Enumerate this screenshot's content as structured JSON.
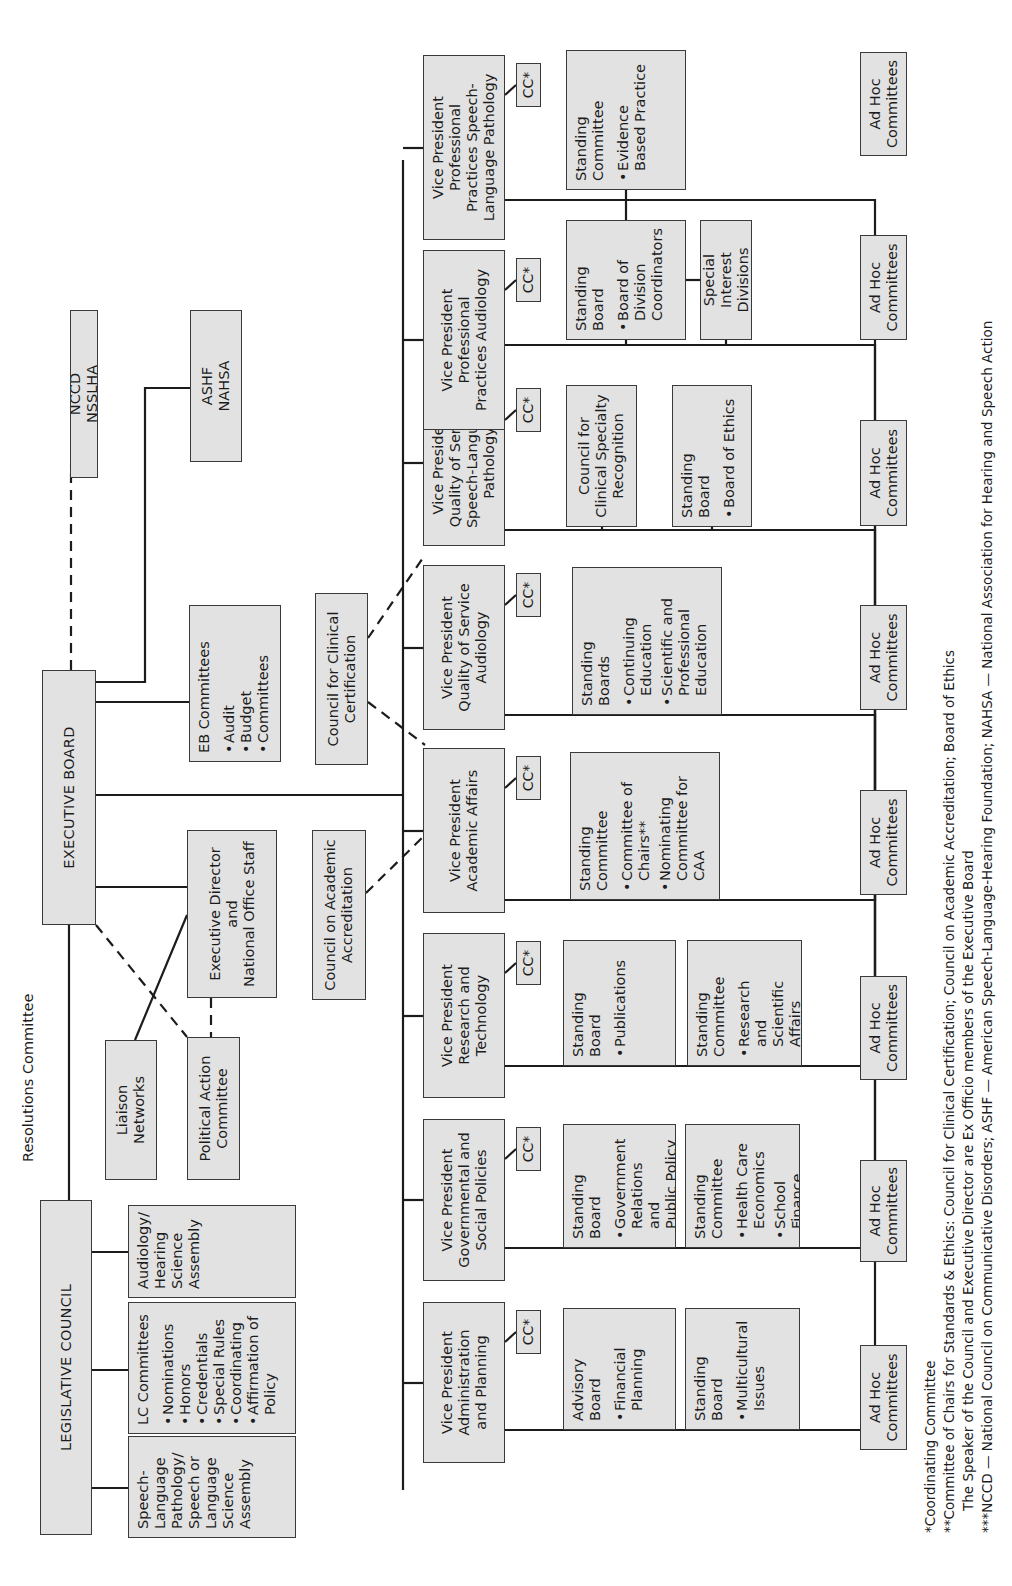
{
  "top_level": {
    "legislative_council": "LEGISLATIVE COUNCIL",
    "executive_board": "EXECUTIVE BOARD",
    "resolutions_committee": "Resolutions Committee",
    "ncc_nsslha": "NCCD\nNSSLHA",
    "ashf_nahsa": "ASHF\nNAHSA"
  },
  "legislative_children": [
    {
      "title": "Speech-\nLanguage\nPathology/\nSpeech or\nLanguage\nScience\nAssembly",
      "items": []
    },
    {
      "title": "LC Committees",
      "items": [
        "Nominations",
        "Honors",
        "Credentials",
        "Special Rules",
        "Coordinating",
        "Affirmation of\nPolicy"
      ]
    },
    {
      "title": "Audiology/\nHearing\nScience\nAssembly",
      "items": []
    }
  ],
  "liaison_networks": "Liaison Networks",
  "political_action_committee": "Political Action\nCommittee",
  "executive_director": "Executive Director\nand\nNational Office Staff",
  "eb_committees": {
    "title": "EB Committees",
    "items": [
      "Audit",
      "Budget",
      "Committees"
    ]
  },
  "council_academic_accreditation": "Council on Academic\nAccreditation",
  "council_clinical_certification": "Council for Clinical\nCertification",
  "cc_label": "CC*",
  "vice_presidents": [
    {
      "title": "Vice President\nAdministration\nand Planning",
      "groups": [
        {
          "title": "Advisory\nBoard",
          "items": [
            "Financial\nPlanning"
          ]
        },
        {
          "title": "Standing\nBoard",
          "items": [
            "Multicultural\nIssues"
          ]
        }
      ],
      "ad_hoc": "Ad Hoc\nCommittees"
    },
    {
      "title": "Vice President\nGovernmental and\nSocial Policies",
      "groups": [
        {
          "title": "Standing\nBoard",
          "items": [
            "Government\nRelations and\nPublic Policy"
          ]
        },
        {
          "title": "Standing\nCommittee",
          "items": [
            "Health Care\nEconomics",
            "School\nFinance"
          ]
        }
      ],
      "ad_hoc": "Ad Hoc\nCommittees"
    },
    {
      "title": "Vice President\nResearch and\nTechnology",
      "groups": [
        {
          "title": "Standing\nBoard",
          "items": [
            "Publications"
          ]
        },
        {
          "title": "Standing\nCommittee",
          "items": [
            "Research and\nScientific\nAffairs"
          ]
        }
      ],
      "ad_hoc": "Ad Hoc\nCommittees"
    },
    {
      "title": "Vice President\nAcademic Affairs",
      "groups": [
        {
          "title": "Standing\nCommittee",
          "items": [
            "Committee of\nChairs**",
            "Nominating\nCommittee for\nCAA"
          ]
        }
      ],
      "ad_hoc": "Ad Hoc\nCommittees"
    },
    {
      "title": "Vice President\nQuality of Service\nAudiology",
      "groups": [
        {
          "title": "Standing\nBoards",
          "items": [
            "Continuing\nEducation",
            "Scientific and\nProfessional\nEducation"
          ]
        }
      ],
      "ad_hoc": "Ad Hoc\nCommittees"
    },
    {
      "title": "Vice President\nQuality of Service\nSpeech-Language\nPathology",
      "groups": [
        {
          "title": "Council for\nClinical Specialty\nRecognition",
          "items": []
        },
        {
          "title": "Standing\nBoard",
          "items": [
            "Board of Ethics"
          ]
        }
      ],
      "ad_hoc": "Ad Hoc\nCommittees"
    },
    {
      "title": "Vice President\nProfessional\nPractices Audiology",
      "groups": [
        {
          "title": "Standing\nBoard",
          "items": [
            "Board of\nDivision\nCoordinators"
          ]
        },
        {
          "title": "Special Interest\nDivisions",
          "items": []
        }
      ],
      "ad_hoc": "Ad Hoc\nCommittees"
    },
    {
      "title": "Vice President\nProfessional\nPractices Speech-\nLanguage Pathology",
      "groups": [
        {
          "title": "Standing\nCommittee",
          "items": [
            "Evidence\nBased Practice"
          ]
        }
      ],
      "ad_hoc": "Ad Hoc\nCommittees"
    }
  ],
  "footnotes": [
    "*Coordinating Committee",
    "**Committee of Chairs for Standards & Ethics: Council for Clinical Certification; Council on Academic Accreditation; Board of Ethics",
    "The Speaker of the Council and Executive Director are Ex Officio members of the Executive Board",
    "***NCCD — National Council on Communicative Disorders; ASHF — American Speech-Language-Hearing Foundation; NAHSA — National Association for Hearing and Speech Action"
  ],
  "colors": {
    "box_fill": "#e2e2e2",
    "line": "#1c1c1c",
    "background": "#ffffff"
  }
}
